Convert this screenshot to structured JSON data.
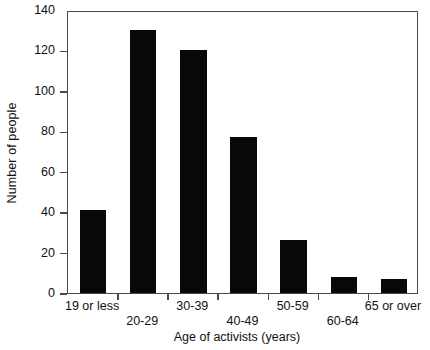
{
  "chart_data": {
    "type": "bar",
    "title": "",
    "subtitle": "",
    "xlabel": "Age of activists (years)",
    "ylabel": "Number of people",
    "categories": [
      "19 or less",
      "20-29",
      "30-39",
      "40-49",
      "50-59",
      "60-64",
      "65 or over"
    ],
    "values": [
      41,
      130,
      120,
      77,
      26,
      8,
      7
    ],
    "ylim": [
      0,
      140
    ],
    "yticks": [
      0,
      20,
      40,
      60,
      80,
      100,
      120,
      140
    ],
    "ytick_labels": [
      "0",
      "20",
      "40",
      "60",
      "80",
      "100",
      "120",
      "140"
    ],
    "grid": false,
    "legend": null,
    "legend_position": "none",
    "bar_color": "#080808",
    "axis_color": "#4a4a4a",
    "label_stagger": [
      "top",
      "bottom",
      "top",
      "bottom",
      "top",
      "bottom",
      "top"
    ],
    "annotations": []
  }
}
